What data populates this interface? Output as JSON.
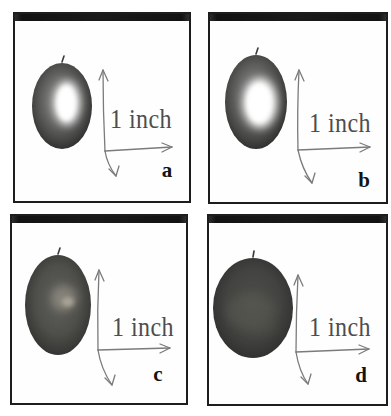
{
  "figure": {
    "panels": [
      {
        "label": "a",
        "scale_label": "1 inch"
      },
      {
        "label": "b",
        "scale_label": "1 inch"
      },
      {
        "label": "c",
        "scale_label": "1 inch"
      },
      {
        "label": "d",
        "scale_label": "1 inch"
      }
    ],
    "colors": {
      "panel_border": "#1d1d1d",
      "top_bar": "#161616",
      "background": "#ffffff",
      "axis_line": "#7b7b7b",
      "scale_text": "#4d4d4d",
      "panel_letter": "#141414",
      "fruit_dark": "#2a2a2a",
      "fruit_mid": "#4c4c4a",
      "fruit_highlight": "#ffffff"
    }
  }
}
